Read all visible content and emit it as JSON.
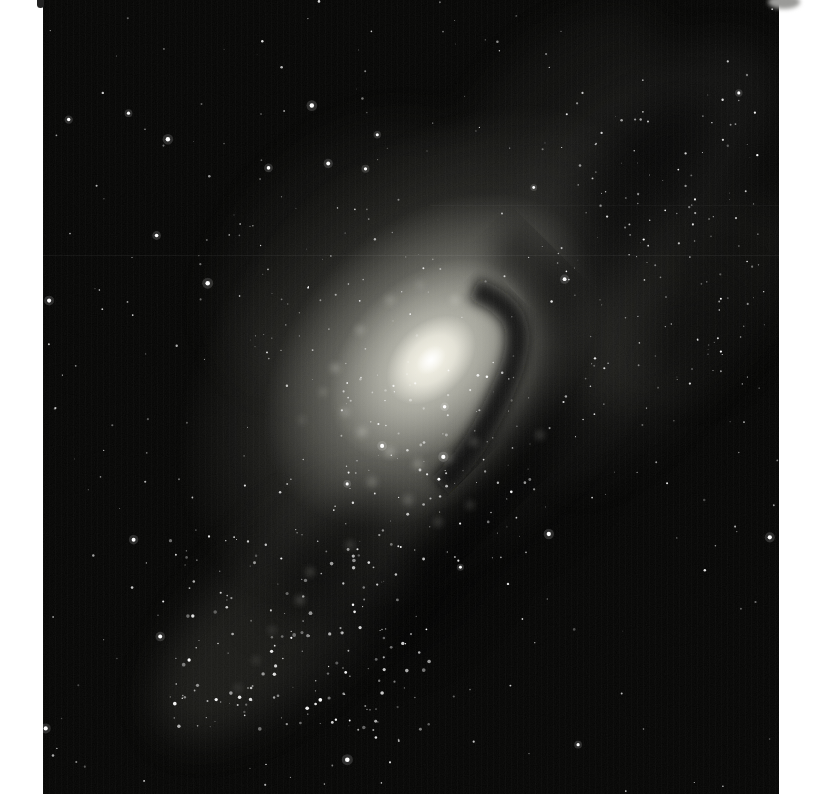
{
  "scene": {
    "type": "astronomical-photograph",
    "subject": "Inclined spiral galaxy with bright whitish nucleus, dark dust lane curving below-right of the core, mottled outer arms with resolved star knots, scattered white stars on a grainy black sky; glossy photographic print with white page margins",
    "print": {
      "left": 43,
      "top": 0,
      "width": 736,
      "height": 794,
      "page_width": 821,
      "page_height": 799
    },
    "colors": {
      "page_background": "#ffffff",
      "sky": "#060605",
      "halo": "#50504a",
      "disk": "#8f8f86",
      "inner_disk": "#c8c8bd",
      "core_glow": "#f6f4e8",
      "nucleus": "#ffffff",
      "dust_lane": "#0a0a09",
      "dark_patch": "#000000",
      "haze": "#bdbdb6",
      "knot": "#e9e9df",
      "star": "#ffffff",
      "smudge": "#9a9a98",
      "notch": "#222222"
    },
    "galaxy": {
      "center_x": 431,
      "center_y": 360,
      "rotation_deg": -45,
      "halo_rx": 300,
      "halo_ry": 205,
      "disk_rx": 195,
      "disk_ry": 135,
      "inner_rx": 118,
      "inner_ry": 82,
      "core_rx": 52,
      "core_ry": 36,
      "nucleus_rx": 17,
      "nucleus_ry": 12
    },
    "haze_patches": [
      {
        "cx": 620,
        "cy": 195,
        "rx": 200,
        "ry": 85,
        "rot": -45,
        "o": 0.07
      },
      {
        "cx": 702,
        "cy": 300,
        "rx": 140,
        "ry": 65,
        "rot": -45,
        "o": 0.05
      },
      {
        "cx": 560,
        "cy": 95,
        "rx": 120,
        "ry": 55,
        "rot": -40,
        "o": 0.05
      },
      {
        "cx": 300,
        "cy": 600,
        "rx": 185,
        "ry": 80,
        "rot": -45,
        "o": 0.065
      },
      {
        "cx": 235,
        "cy": 655,
        "rx": 105,
        "ry": 55,
        "rot": -45,
        "o": 0.05
      },
      {
        "cx": 350,
        "cy": 255,
        "rx": 160,
        "ry": 105,
        "rot": -45,
        "o": 0.05
      },
      {
        "cx": 640,
        "cy": 380,
        "rx": 130,
        "ry": 55,
        "rot": -50,
        "o": 0.045
      }
    ],
    "dark_patches": [
      {
        "cx": 645,
        "cy": 165,
        "rx": 85,
        "ry": 38,
        "rot": -45,
        "o": 0.5
      },
      {
        "cx": 598,
        "cy": 262,
        "rx": 75,
        "ry": 34,
        "rot": -45,
        "o": 0.45
      },
      {
        "cx": 700,
        "cy": 330,
        "rx": 60,
        "ry": 45,
        "rot": -45,
        "o": 0.4
      },
      {
        "cx": 330,
        "cy": 558,
        "rx": 85,
        "ry": 32,
        "rot": -45,
        "o": 0.5
      },
      {
        "cx": 432,
        "cy": 588,
        "rx": 90,
        "ry": 40,
        "rot": -45,
        "o": 0.5
      },
      {
        "cx": 528,
        "cy": 478,
        "rx": 100,
        "ry": 48,
        "rot": -45,
        "o": 0.45
      }
    ],
    "knots": [
      [
        335,
        368,
        4,
        0.35
      ],
      [
        323,
        392,
        3,
        0.3
      ],
      [
        345,
        412,
        4,
        0.3
      ],
      [
        362,
        432,
        5,
        0.3
      ],
      [
        390,
        452,
        5,
        0.3
      ],
      [
        418,
        464,
        5,
        0.28
      ],
      [
        448,
        458,
        4,
        0.26
      ],
      [
        474,
        442,
        4,
        0.24
      ],
      [
        302,
        420,
        3,
        0.22
      ],
      [
        372,
        482,
        5,
        0.24
      ],
      [
        408,
        500,
        5,
        0.22
      ],
      [
        438,
        522,
        4,
        0.2
      ],
      [
        470,
        505,
        4,
        0.18
      ],
      [
        360,
        330,
        4,
        0.3
      ],
      [
        390,
        300,
        4,
        0.28
      ],
      [
        420,
        285,
        3,
        0.25
      ],
      [
        455,
        300,
        4,
        0.3
      ],
      [
        300,
        600,
        4,
        0.25
      ],
      [
        272,
        630,
        3,
        0.22
      ],
      [
        256,
        660,
        3,
        0.2
      ],
      [
        238,
        688,
        3,
        0.2
      ],
      [
        310,
        572,
        4,
        0.22
      ],
      [
        350,
        545,
        4,
        0.2
      ],
      [
        540,
        435,
        4,
        0.22
      ]
    ],
    "stars": {
      "seed": 20240613,
      "field": {
        "count": 270,
        "r_min": 0.4,
        "r_max": 1.3,
        "o_min": 0.25,
        "o_max": 0.9
      },
      "bright": {
        "count": 26,
        "r_min": 1.4,
        "r_max": 2.4
      },
      "clusters": [
        {
          "name": "lower-left-arm",
          "x": 170,
          "y": 530,
          "w": 260,
          "h": 200,
          "count": 150,
          "r_min": 0.5,
          "r_max": 1.9
        },
        {
          "name": "inner-disk",
          "x": 330,
          "y": 370,
          "w": 200,
          "h": 190,
          "count": 95,
          "r_min": 0.4,
          "r_max": 1.5
        },
        {
          "name": "upper-right-arm",
          "x": 540,
          "y": 110,
          "w": 230,
          "h": 320,
          "count": 120,
          "r_min": 0.35,
          "r_max": 1.2
        },
        {
          "name": "upper-left-halo",
          "x": 220,
          "y": 200,
          "w": 200,
          "h": 180,
          "count": 45,
          "r_min": 0.35,
          "r_max": 1.0
        }
      ]
    },
    "artifacts": {
      "stripe_opacity": 0.016,
      "grain_opacity": 0.06,
      "scanlines": [
        {
          "y": 255,
          "x0": 43,
          "x1": 779,
          "o": 0.05
        },
        {
          "y": 205,
          "x0": 430,
          "x1": 779,
          "o": 0.03
        }
      ]
    }
  }
}
